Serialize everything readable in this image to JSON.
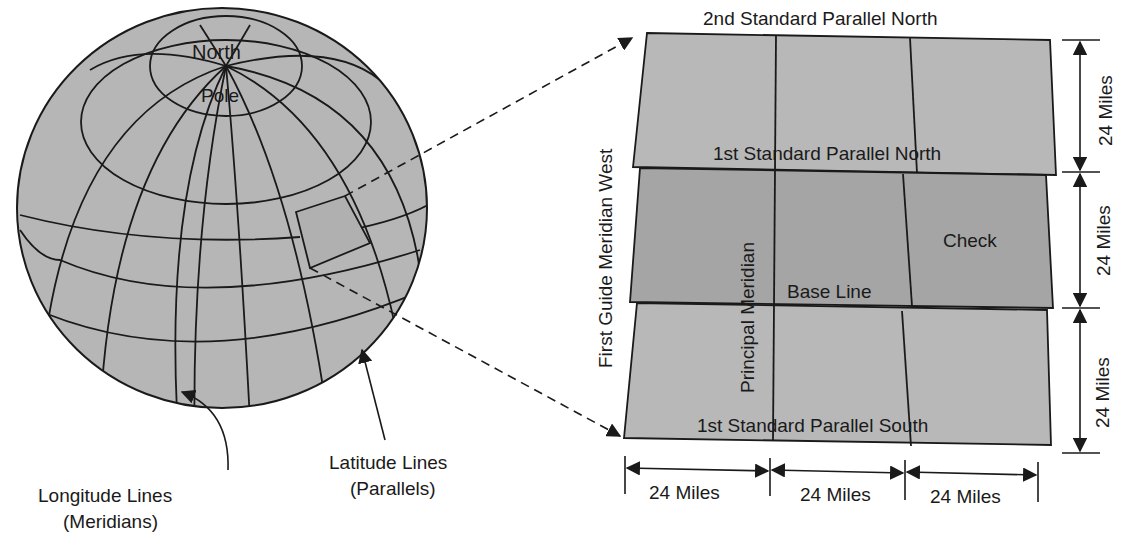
{
  "diagram": {
    "globe": {
      "pole_label_top": "North",
      "pole_label_bottom": "Pole",
      "longitude_label": [
        "Longitude Lines",
        "(Meridians)"
      ],
      "latitude_label": [
        "Latitude Lines",
        "(Parallels)"
      ]
    },
    "grid": {
      "top_label": "2nd Standard Parallel North",
      "parallel_north_1": "1st Standard Parallel North",
      "parallel_south_1": "1st Standard Parallel South",
      "base_line": "Base Line",
      "check": "Check",
      "principal_meridian": "Principal Meridian",
      "guide_meridian": "First Guide Meridian West",
      "vertical_dims": [
        "24 Miles",
        "24 Miles",
        "24 Miles"
      ],
      "horizontal_dims": [
        "24 Miles",
        "24 Miles",
        "24 Miles"
      ]
    },
    "colors": {
      "fill": "#b4b4b4",
      "fill_dark": "#a2a2a2",
      "line": "#1a1a1a"
    }
  }
}
